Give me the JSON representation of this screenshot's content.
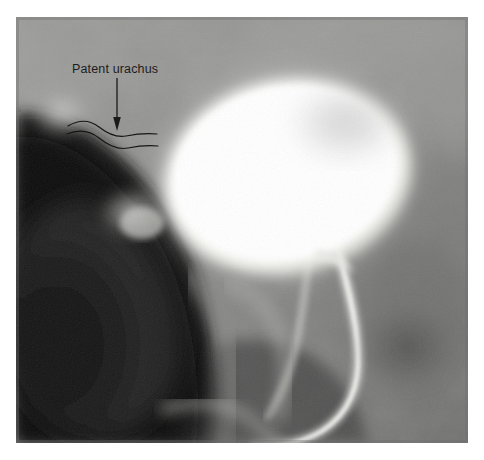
{
  "image": {
    "kind": "radiograph",
    "modality_label": "cystogram",
    "plate": {
      "left": 16,
      "top": 17,
      "width": 452,
      "height": 426,
      "background_color": "#8a8a8a",
      "margin_color": "#ffffff"
    },
    "tones": {
      "contrast_bright": "#fdfdfb",
      "contrast_bright_core": "#ffffff",
      "soft_tissue_light": "#b9b9b7",
      "soft_tissue_mid": "#8d8d8c",
      "soft_tissue_dark": "#5c5c5c",
      "shadow_deep": "#242424",
      "shadow_black": "#131313",
      "catheter": "#d8d8d4"
    }
  },
  "annotations": {
    "label": {
      "text": "Patent urachus",
      "color": "#1d1d1d",
      "x": 72,
      "y": 62
    },
    "arrow": {
      "name": "pointer-arrow",
      "color": "#1a1a1a",
      "x": 117,
      "y_start": 78,
      "y_end": 131
    },
    "tract_lines": {
      "name": "urachal-tract-outline",
      "color": "#161616",
      "count": 2,
      "x_start": 68,
      "x_end": 157
    }
  },
  "structures": [
    {
      "name": "contrast-filled-bladder",
      "description": "opacified urinary bladder"
    },
    {
      "name": "urinary-catheter",
      "description": "radiopaque catheter curving inferiorly"
    },
    {
      "name": "patent-urachus-tract",
      "description": "urachal channel toward umbilicus"
    },
    {
      "name": "bowel-gas-shadow",
      "description": "dark lucent region left of bladder"
    }
  ]
}
